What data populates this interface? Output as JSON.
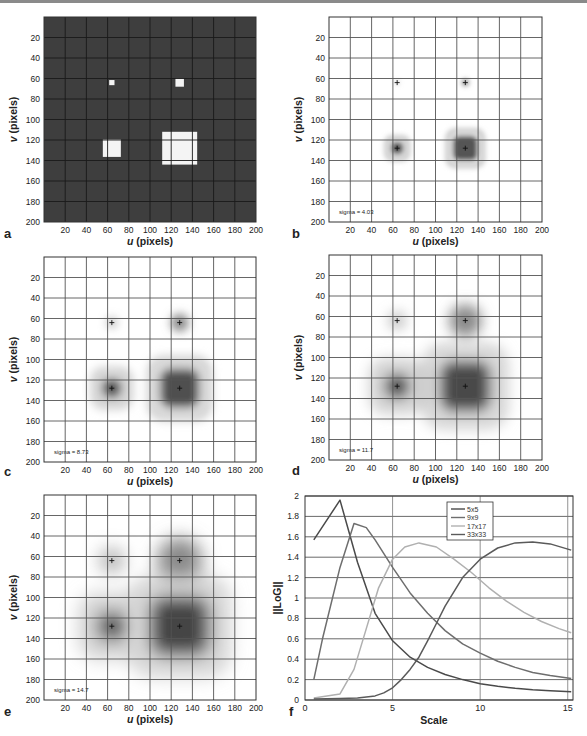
{
  "figure": {
    "panels": [
      {
        "id": "a",
        "label": "a",
        "type": "image",
        "background": "dark",
        "sigma": null
      },
      {
        "id": "b",
        "label": "b",
        "type": "image",
        "background": "light",
        "sigma": "sigma = 4.03"
      },
      {
        "id": "c",
        "label": "c",
        "type": "image",
        "background": "light",
        "sigma": "sigma = 8.73"
      },
      {
        "id": "d",
        "label": "d",
        "type": "image",
        "background": "light",
        "sigma": "sigma = 11.7"
      },
      {
        "id": "e",
        "label": "e",
        "type": "image",
        "background": "light",
        "sigma": "sigma = 14.7"
      },
      {
        "id": "f",
        "label": "f",
        "type": "line"
      }
    ],
    "image_axes": {
      "xlabel_italic": "u",
      "xlabel_rest": " (pixels)",
      "ylabel_italic": "v",
      "ylabel_rest": " (pixels)",
      "xticks": [
        "20",
        "40",
        "60",
        "80",
        "100",
        "120",
        "140",
        "160",
        "180",
        "200"
      ],
      "yticks": [
        "20",
        "40",
        "60",
        "80",
        "100",
        "120",
        "140",
        "160",
        "180",
        "200"
      ]
    }
  },
  "chart_data": [
    {
      "type": "heatmap",
      "panel": "a",
      "title": "",
      "xlabel": "u (pixels)",
      "ylabel": "v (pixels)",
      "xlim": [
        0,
        200
      ],
      "ylim": [
        200,
        0
      ],
      "grid": true,
      "squares": [
        {
          "cx": 64,
          "cy": 64,
          "size": 5
        },
        {
          "cx": 128,
          "cy": 64,
          "size": 9
        },
        {
          "cx": 64,
          "cy": 128,
          "size": 17
        },
        {
          "cx": 128,
          "cy": 128,
          "size": 33
        }
      ]
    },
    {
      "type": "heatmap",
      "panel": "b",
      "annotation": "sigma = 4.03",
      "xlabel": "u (pixels)",
      "ylabel": "v (pixels)",
      "xlim": [
        0,
        200
      ],
      "ylim": [
        200,
        0
      ],
      "markers": [
        [
          64,
          64
        ],
        [
          128,
          64
        ],
        [
          64,
          128
        ],
        [
          128,
          128
        ]
      ]
    },
    {
      "type": "heatmap",
      "panel": "c",
      "annotation": "sigma = 8.73",
      "xlabel": "u (pixels)",
      "ylabel": "v (pixels)",
      "xlim": [
        0,
        200
      ],
      "ylim": [
        200,
        0
      ],
      "markers": [
        [
          64,
          64
        ],
        [
          128,
          64
        ],
        [
          64,
          128
        ],
        [
          128,
          128
        ]
      ]
    },
    {
      "type": "heatmap",
      "panel": "d",
      "annotation": "sigma = 11.7",
      "xlabel": "u (pixels)",
      "ylabel": "v (pixels)",
      "xlim": [
        0,
        200
      ],
      "ylim": [
        200,
        0
      ],
      "markers": [
        [
          64,
          64
        ],
        [
          128,
          64
        ],
        [
          64,
          128
        ],
        [
          128,
          128
        ]
      ]
    },
    {
      "type": "heatmap",
      "panel": "e",
      "annotation": "sigma = 14.7",
      "xlabel": "u (pixels)",
      "ylabel": "v (pixels)",
      "xlim": [
        0,
        200
      ],
      "ylim": [
        200,
        0
      ],
      "markers": [
        [
          64,
          64
        ],
        [
          128,
          64
        ],
        [
          64,
          128
        ],
        [
          128,
          128
        ]
      ]
    },
    {
      "type": "line",
      "panel": "f",
      "title": "",
      "xlabel": "Scale",
      "ylabel": "||LoG||",
      "xlim": [
        0,
        15.3
      ],
      "ylim": [
        0,
        2
      ],
      "xticks": [
        "0",
        "5",
        "10",
        "15"
      ],
      "yticks": [
        "0",
        "0.2",
        "0.4",
        "0.6",
        "0.8",
        "1",
        "1.2",
        "1.4",
        "1.6",
        "1.8",
        "2"
      ],
      "grid": true,
      "legend_position": "upper-center",
      "series": [
        {
          "name": "5x5",
          "color": "#4a4a4a",
          "x": [
            0.5,
            2,
            3,
            4,
            5,
            6,
            7,
            8,
            9,
            10,
            11,
            12,
            13,
            14,
            15.2
          ],
          "y": [
            1.57,
            1.96,
            1.35,
            0.85,
            0.58,
            0.42,
            0.32,
            0.25,
            0.2,
            0.16,
            0.135,
            0.115,
            0.1,
            0.09,
            0.08
          ]
        },
        {
          "name": "9x9",
          "color": "#6e6e6e",
          "x": [
            0.5,
            1,
            2,
            2.8,
            3.5,
            4,
            5,
            6,
            7,
            8,
            9,
            10,
            11,
            12,
            13,
            14,
            15.2
          ],
          "y": [
            0.2,
            0.6,
            1.3,
            1.73,
            1.69,
            1.57,
            1.3,
            1.05,
            0.85,
            0.68,
            0.55,
            0.46,
            0.38,
            0.32,
            0.27,
            0.24,
            0.21
          ]
        },
        {
          "name": "17x17",
          "color": "#b0b0b0",
          "x": [
            0.5,
            2,
            2.8,
            3.5,
            4.2,
            5,
            5.7,
            6.5,
            7.5,
            8.5,
            9.5,
            10.5,
            11.5,
            12.5,
            13.5,
            14.5,
            15.2
          ],
          "y": [
            0.02,
            0.06,
            0.3,
            0.7,
            1.1,
            1.38,
            1.5,
            1.54,
            1.5,
            1.38,
            1.25,
            1.1,
            0.97,
            0.86,
            0.77,
            0.7,
            0.66
          ]
        },
        {
          "name": "33x33",
          "color": "#5a5a5a",
          "x": [
            0.5,
            2,
            3,
            4,
            4.5,
            5,
            5.5,
            6,
            6.5,
            7,
            7.5,
            8,
            9,
            10,
            11,
            12,
            13,
            14,
            15.2
          ],
          "y": [
            0.01,
            0.015,
            0.02,
            0.04,
            0.07,
            0.12,
            0.2,
            0.3,
            0.42,
            0.58,
            0.75,
            0.92,
            1.2,
            1.38,
            1.49,
            1.54,
            1.55,
            1.53,
            1.47
          ]
        }
      ]
    }
  ]
}
